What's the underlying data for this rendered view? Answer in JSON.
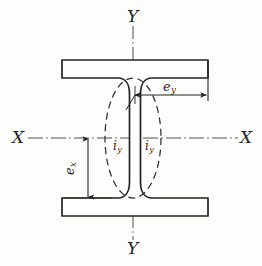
{
  "figure": {
    "background_color": "#fdfdfc",
    "line_color": "#232323",
    "axis_color": "#3a3a3a",
    "dash_color": "#2f2f2f"
  },
  "axes": {
    "vertical_top_label": "Y",
    "vertical_bottom_label": "Y",
    "horizontal_left_label": "X",
    "horizontal_right_label": "X"
  },
  "dimensions": {
    "ey": {
      "symbol": "e",
      "subscript": "y"
    },
    "ex": {
      "symbol": "e",
      "subscript": "x"
    }
  },
  "gyration": {
    "left": {
      "symbol": "i",
      "subscript": "y"
    },
    "right": {
      "symbol": "i",
      "subscript": "y"
    }
  },
  "icons": {
    "arrow_right": "arrow-right-icon",
    "arrow_left": "arrow-left-icon",
    "arrow_up": "arrow-up-icon",
    "arrow_down": "arrow-down-icon"
  }
}
